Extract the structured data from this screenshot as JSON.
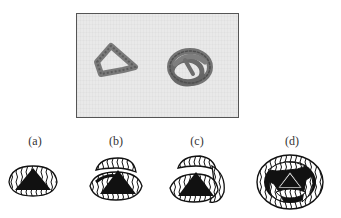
{
  "photo": {
    "description": "Photograph of two coiled rope/tube objects on textured background: a triangular loop (left) and a tangled knot (right)"
  },
  "panels": [
    {
      "label": "(a)",
      "description": "single coil around a dark triangle"
    },
    {
      "label": "(b)",
      "description": "two coils around a dark triangle"
    },
    {
      "label": "(c)",
      "description": "three coils around a dark triangle"
    },
    {
      "label": "(d)",
      "description": "four interlocked coils forming a rounded knot around a dark triangle"
    }
  ],
  "colors": {
    "background": "#ffffff",
    "photo_bg": "#e9e9e9",
    "object_gray": "#6f6f6f",
    "ink": "#111111"
  }
}
